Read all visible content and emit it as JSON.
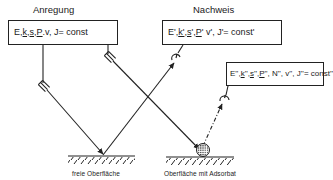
{
  "diagram": {
    "sections": {
      "excitation_title": "Anregung",
      "detection_title": "Nachweis"
    },
    "boxes": {
      "excitation": {
        "parts": [
          "E, ",
          "k",
          ", ",
          "s",
          " ,",
          "P",
          ".v, J",
          "  = const"
        ]
      },
      "detection_primary": {
        "parts": [
          "E', ",
          "k'",
          ", ",
          "s",
          " ', ",
          "P",
          "' v', J'",
          "   = const'"
        ]
      },
      "detection_secondary": {
        "parts": [
          "E'', ",
          "k",
          "'', ",
          "s",
          " '', ",
          "P",
          "'', N'', v'', J'' ",
          "= const''"
        ]
      }
    },
    "captions": {
      "free_surface": "freie  Oberfläche",
      "adsorbate_surface": "Oberfläche mit Adsorbat"
    },
    "colors": {
      "line": "#222222",
      "background": "#ffffff"
    },
    "elements": {
      "source_icon": "source-icon",
      "detector_icon": "detector-icon",
      "adsorbate_icon": "adsorbate-particle-icon",
      "surface_icon": "hatched-surface-icon"
    }
  }
}
